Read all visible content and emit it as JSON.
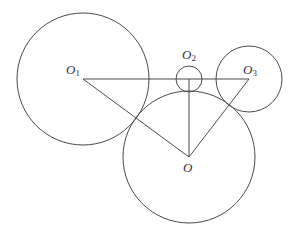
{
  "diagram": {
    "stroke_color": "#4a4a4a",
    "circles": [
      {
        "name": "O1",
        "cx": 83,
        "cy": 79,
        "r": 66
      },
      {
        "name": "O2",
        "cx": 189,
        "cy": 79,
        "r": 13
      },
      {
        "name": "O3",
        "cx": 249,
        "cy": 79,
        "r": 33
      },
      {
        "name": "O",
        "cx": 189,
        "cy": 157,
        "r": 66
      }
    ],
    "points": {
      "O1": {
        "x": 83,
        "y": 79
      },
      "O2": {
        "x": 189,
        "y": 79
      },
      "O3": {
        "x": 249,
        "y": 79
      },
      "O": {
        "x": 189,
        "y": 157
      }
    },
    "segments": [
      [
        "O1",
        "O3"
      ],
      [
        "O1",
        "O"
      ],
      [
        "O3",
        "O"
      ],
      [
        "O2",
        "O"
      ]
    ],
    "labels": {
      "o1": {
        "main": "O",
        "sub": "1"
      },
      "o2": {
        "main": "O",
        "sub": "2"
      },
      "o3": {
        "main": "O",
        "sub": "3"
      },
      "o": {
        "main": "O"
      }
    }
  }
}
